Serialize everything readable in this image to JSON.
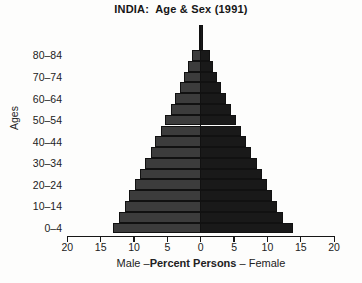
{
  "title": "INDIA:  Age & Sex (1991)",
  "y_axis": {
    "label": "Ages",
    "tick_labels": [
      "80–84",
      "70–74",
      "60–64",
      "50–54",
      "40–44",
      "30–34",
      "20–24",
      "10–14",
      "0–4"
    ]
  },
  "x_axis": {
    "tick_labels": [
      "20",
      "15",
      "10",
      "5",
      "0",
      "5",
      "10",
      "15",
      "20"
    ],
    "label_left": "Male –",
    "label_bold": "Percent Persons",
    "label_right": " – Female"
  },
  "colors": {
    "male_fill": "#3c3c3c",
    "female_fill": "#191919",
    "line": "#111111",
    "background": "#fdfdfc"
  },
  "chart_data": {
    "type": "bar",
    "subtype": "population-pyramid",
    "title": "INDIA: Age & Sex (1991)",
    "categories": [
      "0–4",
      "5–9",
      "10–14",
      "15–19",
      "20–24",
      "25–29",
      "30–34",
      "35–39",
      "40–44",
      "45–49",
      "50–54",
      "55–59",
      "60–64",
      "65–69",
      "70–74",
      "75–79",
      "80–84",
      "85+"
    ],
    "series": [
      {
        "name": "Male",
        "values": [
          13.1,
          12.2,
          11.4,
          10.7,
          9.9,
          9.1,
          8.3,
          7.5,
          6.8,
          6.0,
          5.3,
          4.5,
          3.8,
          3.1,
          2.5,
          1.9,
          1.3,
          0.3
        ]
      },
      {
        "name": "Female",
        "values": [
          13.9,
          12.4,
          11.5,
          10.7,
          9.9,
          9.2,
          8.4,
          7.6,
          6.8,
          6.1,
          5.3,
          4.6,
          3.8,
          3.1,
          2.4,
          1.8,
          1.4,
          0.3
        ]
      }
    ],
    "xlabel": "Male –Percent Persons – Female",
    "ylabel": "Ages",
    "xlim": [
      -20,
      20
    ],
    "units": "percent of persons",
    "legend_position": "none",
    "grid": false
  }
}
